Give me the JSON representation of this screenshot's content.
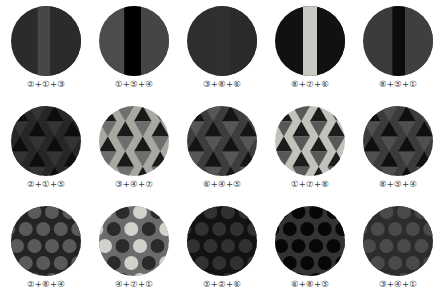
{
  "figure": {
    "name": "texture-swatch-grid",
    "background": "#ffffff",
    "columns": 5,
    "rows": 3
  },
  "swatches": [
    {
      "id": "r1c1",
      "pattern": "vertical-stripes",
      "label": "②+①+③",
      "codes": [
        2,
        1,
        3
      ],
      "colors": [
        "#2b2b2b",
        "#474747",
        "#2b2b2b"
      ],
      "stripe_offsets": [
        0,
        0.38,
        0.56
      ]
    },
    {
      "id": "r1c2",
      "pattern": "vertical-stripes",
      "label": "①+⑤+④",
      "codes": [
        1,
        5,
        4
      ],
      "colors": [
        "#4c4c4c",
        "#000000",
        "#454545"
      ],
      "stripe_offsets": [
        0,
        0.36,
        0.6
      ]
    },
    {
      "id": "r1c3",
      "pattern": "vertical-stripes",
      "label": "③+⑧+⑥",
      "codes": [
        3,
        8,
        6
      ],
      "colors": [
        "#2e2e2e",
        "#303030",
        "#2a2a2a"
      ],
      "stripe_offsets": [
        0,
        0.4,
        0.62
      ]
    },
    {
      "id": "r1c4",
      "pattern": "vertical-stripes",
      "label": "⑧+⑦+⑥",
      "codes": [
        8,
        7,
        6
      ],
      "colors": [
        "#111111",
        "#c9c9c4",
        "#111111"
      ],
      "stripe_offsets": [
        0,
        0.4,
        0.6
      ]
    },
    {
      "id": "r1c5",
      "pattern": "vertical-stripes",
      "label": "⑧+⑤+①",
      "codes": [
        8,
        5,
        1
      ],
      "colors": [
        "#3a3a3a",
        "#0b0b0b",
        "#3f3f3f"
      ],
      "stripe_offsets": [
        0,
        0.42,
        0.6
      ]
    },
    {
      "id": "r2c1",
      "pattern": "triangles",
      "label": "②+①+⑤",
      "codes": [
        2,
        1,
        5
      ],
      "colors": [
        "#262626",
        "#0d0d0d",
        "#343434"
      ]
    },
    {
      "id": "r2c2",
      "pattern": "triangles",
      "label": "③+④+⑦",
      "codes": [
        3,
        4,
        7
      ],
      "colors": [
        "#a8a8a3",
        "#1a1a1a",
        "#6e6e6e"
      ]
    },
    {
      "id": "r2c3",
      "pattern": "triangles",
      "label": "⑥+④+⑤",
      "codes": [
        6,
        4,
        5
      ],
      "colors": [
        "#3d3d3d",
        "#141414",
        "#565656"
      ]
    },
    {
      "id": "r2c4",
      "pattern": "triangles",
      "label": "①+⑦+⑧",
      "codes": [
        1,
        7,
        8
      ],
      "colors": [
        "#c2c2bd",
        "#1c1c1c",
        "#585858"
      ]
    },
    {
      "id": "r2c5",
      "pattern": "triangles",
      "label": "⑧+⑤+④",
      "codes": [
        8,
        5,
        4
      ],
      "colors": [
        "#3b3b3b",
        "#0f0f0f",
        "#4f4f4f"
      ]
    },
    {
      "id": "r3c1",
      "pattern": "dots",
      "label": "②+⑧+④",
      "codes": [
        2,
        8,
        4
      ],
      "colors": [
        "#242424",
        "#5a5a5a"
      ]
    },
    {
      "id": "r3c2",
      "pattern": "dots",
      "label": "④+⑦+①",
      "codes": [
        4,
        7,
        1
      ],
      "colors": [
        "#6b6b6b",
        "#d2d2cd",
        "#2a2a2a"
      ]
    },
    {
      "id": "r3c3",
      "pattern": "dots",
      "label": "⑤+②+⑥",
      "codes": [
        5,
        2,
        6
      ],
      "colors": [
        "#121212",
        "#313131"
      ]
    },
    {
      "id": "r3c4",
      "pattern": "dots",
      "label": "⑥+⑧+⑤",
      "codes": [
        6,
        8,
        5
      ],
      "colors": [
        "#333333",
        "#070707"
      ]
    },
    {
      "id": "r3c5",
      "pattern": "dots",
      "label": "③+④+①",
      "codes": [
        3,
        4,
        1
      ],
      "colors": [
        "#2c2c2c",
        "#4a4a4a"
      ]
    }
  ]
}
